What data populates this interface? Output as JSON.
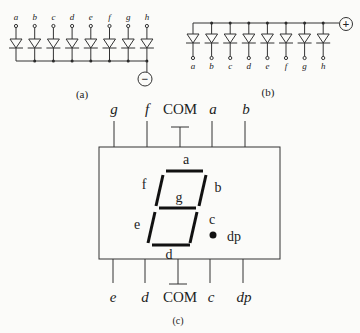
{
  "diagram_a": {
    "caption": "(a)",
    "pins": [
      "a",
      "b",
      "c",
      "d",
      "e",
      "f",
      "g",
      "h"
    ],
    "common_terminal": "−",
    "type": "common-cathode"
  },
  "diagram_b": {
    "caption": "(b)",
    "pins": [
      "a",
      "b",
      "c",
      "d",
      "e",
      "f",
      "g",
      "h"
    ],
    "common_terminal": "+",
    "type": "common-anode"
  },
  "diagram_c": {
    "caption": "(c)",
    "top_pins": [
      "g",
      "f",
      "COM",
      "a",
      "b"
    ],
    "bottom_pins": [
      "e",
      "d",
      "COM",
      "c",
      "dp"
    ],
    "segment_labels": {
      "a": "a",
      "b": "b",
      "c": "c",
      "d": "d",
      "e": "e",
      "f": "f",
      "g": "g",
      "dp": "dp"
    }
  }
}
